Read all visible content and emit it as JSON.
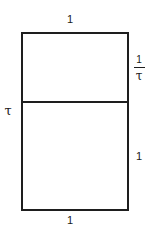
{
  "diagram": {
    "labels": {
      "top_width": "1",
      "bottom_width": "1",
      "left_height": "τ",
      "right_upper_height": {
        "numerator": "1",
        "denominator": "τ"
      },
      "right_lower_height": "1"
    },
    "colors": {
      "line": "#1e1e1e",
      "background": "#ffffff"
    }
  }
}
